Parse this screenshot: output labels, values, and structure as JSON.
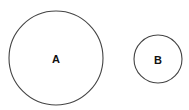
{
  "diagram": {
    "circles": [
      {
        "label": "A",
        "cx": 56,
        "cy": 58,
        "r": 47
      },
      {
        "label": "B",
        "cx": 158,
        "cy": 59,
        "r": 24
      }
    ],
    "stroke_color": "#444444",
    "background": "#ffffff"
  }
}
